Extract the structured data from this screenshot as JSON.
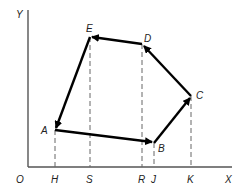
{
  "diagram": {
    "axes": {
      "origin_label": "O",
      "x_label": "X",
      "y_label": "Y"
    },
    "points": [
      {
        "name": "A",
        "label": "A",
        "x": 55,
        "y": 130
      },
      {
        "name": "B",
        "label": "B",
        "x": 154,
        "y": 143
      },
      {
        "name": "C",
        "label": "C",
        "x": 191,
        "y": 96
      },
      {
        "name": "D",
        "label": "D",
        "x": 142,
        "y": 44
      },
      {
        "name": "E",
        "label": "E",
        "x": 90,
        "y": 37
      }
    ],
    "path_order": [
      "A",
      "B",
      "C",
      "D",
      "E",
      "A"
    ],
    "x_ticks": [
      {
        "label": "H",
        "projects": "A"
      },
      {
        "label": "S",
        "projects": "E"
      },
      {
        "label": "R",
        "projects": "D"
      },
      {
        "label": "J",
        "projects": "B"
      },
      {
        "label": "K",
        "projects": "C"
      }
    ],
    "colors": {
      "vector": "#000000",
      "axis": "#555555",
      "projection": "#666666"
    }
  }
}
